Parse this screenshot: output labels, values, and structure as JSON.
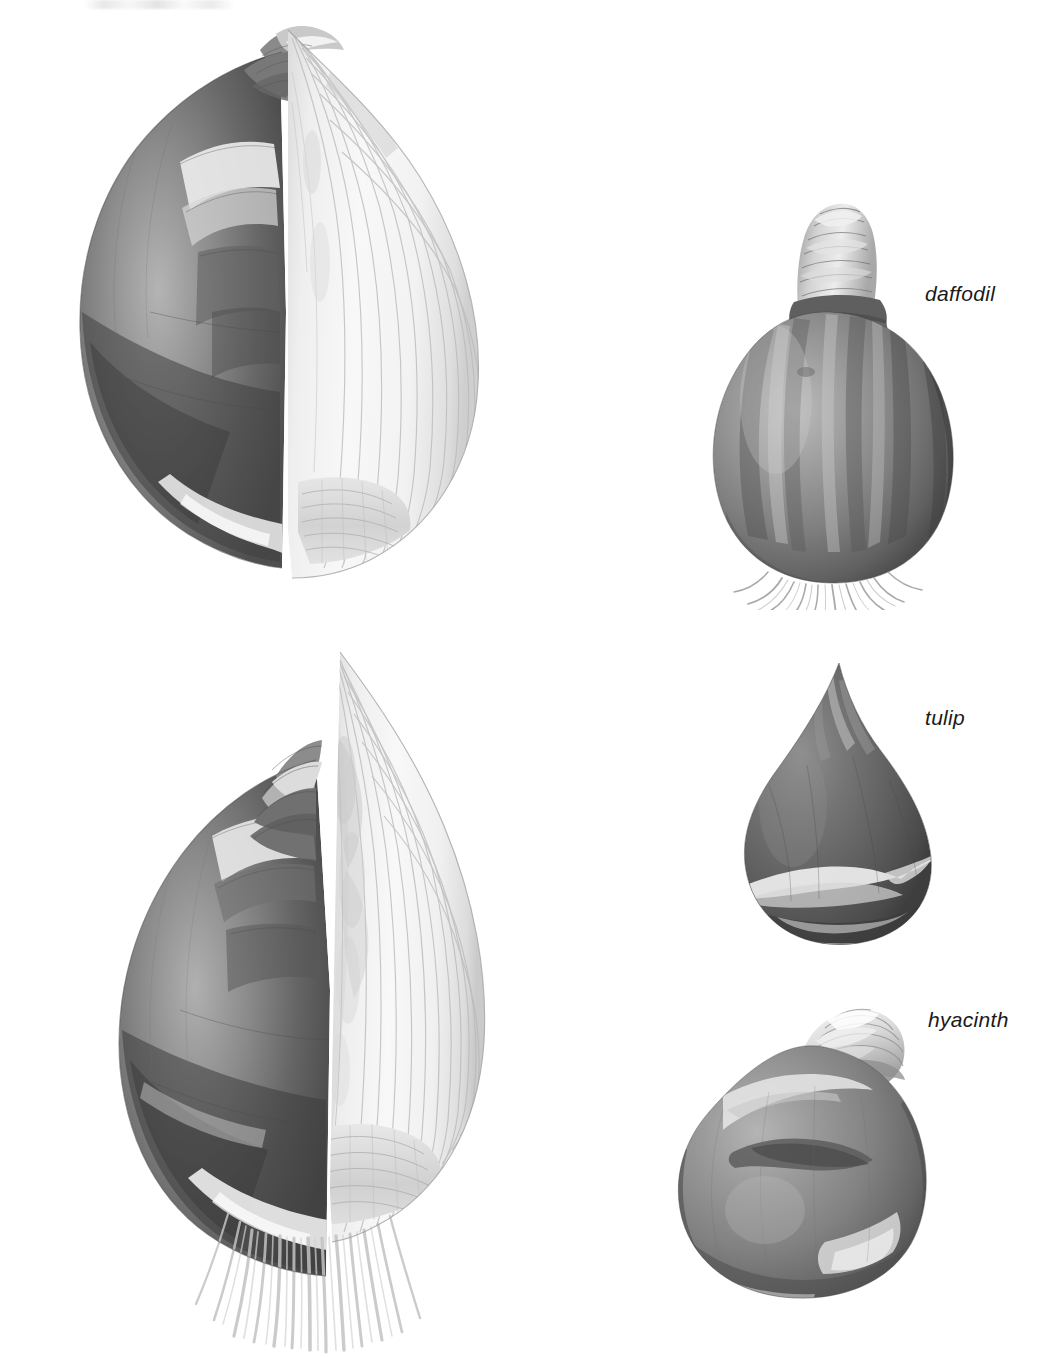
{
  "page": {
    "kind": "botanical-illustration-plate",
    "background_color": "#ffffff",
    "width": 1057,
    "height": 1358,
    "style": "halftone grayscale engraving / airbrush plate"
  },
  "labels": {
    "daffodil": "daffodil",
    "tulip": "tulip",
    "hyacinth": "hyacinth"
  },
  "figures": [
    {
      "id": "onion-bulb-large-top",
      "name": "large bulb cut in half, upper",
      "description": "Large onion-like bulb shown halved lengthwise; dark papery tunic on the left, pale concentric fleshy scales exposed on the right, basal plate at the bottom",
      "has_label": false
    },
    {
      "id": "onion-bulb-large-bottom",
      "name": "large bulb cut in half with roots, lower",
      "description": "Second large bulb halved lengthwise showing the inner flower shoot between the scales, with a fringe of fleshy roots below the basal plate",
      "has_label": false
    },
    {
      "id": "daffodil-bulb",
      "name": "daffodil bulb",
      "description": "Rounded dark bulb with a wrinkled papery neck and fine roots",
      "has_label": true,
      "label_key": "daffodil"
    },
    {
      "id": "tulip-bulb",
      "name": "tulip bulb",
      "description": "Dark teardrop-shaped bulb with a pointed apex and pale torn tunic near the base",
      "has_label": true,
      "label_key": "tulip"
    },
    {
      "id": "hyacinth-bulb",
      "name": "hyacinth bulb",
      "description": "Rounded mid-grey bulb with a pale coiled neck and a dark blotch on the body",
      "has_label": true,
      "label_key": "hyacinth"
    }
  ],
  "colors": {
    "paper": "#ffffff",
    "ink_dark": "#4a4a4a",
    "ink_mid": "#8a8a8a",
    "ink_light": "#d8d8d8",
    "label_text": "#1a1a1a"
  }
}
